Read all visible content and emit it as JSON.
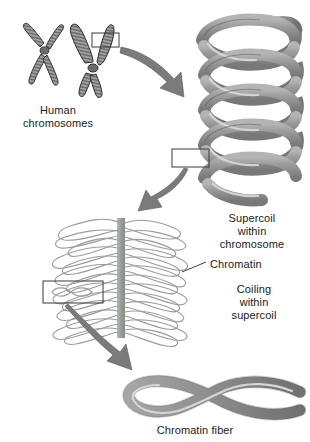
{
  "figure": {
    "background_color": "#ffffff",
    "width": 310,
    "height": 442
  },
  "labels": {
    "human_chromosomes": "Human\nchromosomes",
    "supercoil": "Supercoil\nwithin\nchromosome",
    "chromatin": "Chromatin",
    "coiling": "Coiling\nwithin\nsupercoil",
    "chromatin_fiber": "Chromatin fiber"
  },
  "colors": {
    "ink": "#1a1a1a",
    "ribbon_fill": "#8d8d8d",
    "ribbon_dark": "#6f6f6f",
    "ribbon_highlight": "#d4d4d4",
    "chromosome_fill": "#9a9a9a",
    "chromosome_band": "#6b6b6b",
    "scaffold": "#9fa59c",
    "loop_stroke": "#9b9b9b",
    "arrow_fill": "#7b7b7b",
    "box_stroke": "#3a3a3a",
    "outline": "#2b2b2b"
  },
  "elements": {
    "chromosome_small": "human-chromosome-small",
    "chromosome_large": "human-chromosome-large",
    "supercoil_helix": "supercoil-helix",
    "chromatin_loops": "chromatin-loop-domain",
    "chromatin_fiber": "chromatin-fiber-ribbon",
    "callout_box_chromosome": "callout-box-on-chromosome",
    "callout_box_supercoil": "callout-box-on-supercoil",
    "callout_box_chromatin": "callout-box-on-chromatin",
    "arrow_1": "arrow-chromosome-to-supercoil",
    "arrow_2": "arrow-supercoil-to-chromatin",
    "arrow_3": "arrow-chromatin-to-fiber",
    "leader_chromatin": "leader-line-chromatin"
  }
}
